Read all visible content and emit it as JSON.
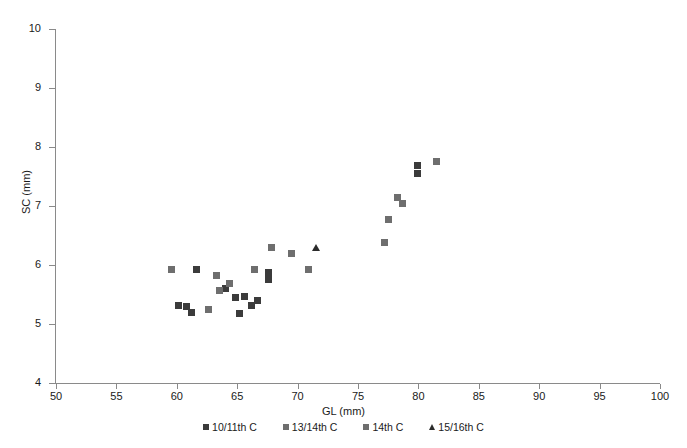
{
  "chart_data": {
    "type": "scatter",
    "title": "",
    "xlabel": "GL (mm)",
    "ylabel": "SC (mm)",
    "xlim": [
      50,
      100
    ],
    "ylim": [
      4,
      10
    ],
    "xticks": [
      50,
      55,
      60,
      65,
      70,
      75,
      80,
      85,
      90,
      95,
      100
    ],
    "yticks": [
      4,
      5,
      6,
      7,
      8,
      9,
      10
    ],
    "grid": false,
    "legend_position": "bottom-center",
    "series": [
      {
        "name": "10/11th C",
        "marker": "square",
        "color": "#3b3b3b",
        "points": [
          [
            61.6,
            5.92
          ],
          [
            60.1,
            5.32
          ],
          [
            60.8,
            5.3
          ],
          [
            61.2,
            5.19
          ],
          [
            64.0,
            5.6
          ],
          [
            64.9,
            5.45
          ],
          [
            65.6,
            5.47
          ],
          [
            66.2,
            5.31
          ],
          [
            66.7,
            5.4
          ],
          [
            65.2,
            5.18
          ],
          [
            67.6,
            5.88
          ],
          [
            67.6,
            5.75
          ],
          [
            79.9,
            7.69
          ],
          [
            79.9,
            7.55
          ]
        ]
      },
      {
        "name": "13/14th C",
        "marker": "square",
        "color": "#6e6e6e",
        "points": [
          [
            59.6,
            5.92
          ],
          [
            63.3,
            5.83
          ],
          [
            63.5,
            5.57
          ],
          [
            62.6,
            5.25
          ],
          [
            69.5,
            6.2
          ],
          [
            67.8,
            6.3
          ],
          [
            77.2,
            6.38
          ]
        ]
      },
      {
        "name": "14th C",
        "marker": "square",
        "color": "#6e6e6e",
        "points": [
          [
            64.4,
            5.68
          ],
          [
            66.4,
            5.92
          ],
          [
            70.9,
            5.92
          ],
          [
            81.5,
            7.76
          ],
          [
            78.3,
            7.14
          ],
          [
            78.7,
            7.04
          ],
          [
            77.5,
            6.77
          ]
        ]
      },
      {
        "name": "15/16th C",
        "marker": "triangle",
        "color": "#2b2b2b",
        "points": [
          [
            71.5,
            6.28
          ]
        ]
      }
    ]
  },
  "axes": {
    "x_title": "GL (mm)",
    "y_title": "SC (mm)",
    "x_tick_labels": [
      "50",
      "55",
      "60",
      "65",
      "70",
      "75",
      "80",
      "85",
      "90",
      "95",
      "100"
    ],
    "y_tick_labels": [
      "4",
      "5",
      "6",
      "7",
      "8",
      "9",
      "10"
    ],
    "axis_color": "#8a8a8a"
  },
  "legend": {
    "entries": [
      {
        "label": "10/11th C",
        "marker": "square",
        "color": "#3b3b3b"
      },
      {
        "label": "13/14th C",
        "marker": "square",
        "color": "#6e6e6e"
      },
      {
        "label": "14th C",
        "marker": "square",
        "color": "#6e6e6e"
      },
      {
        "label": "15/16th C",
        "marker": "triangle",
        "color": "#2b2b2b"
      }
    ]
  }
}
